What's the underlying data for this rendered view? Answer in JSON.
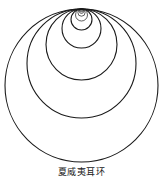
{
  "caption": "夏威夷耳环",
  "diagram": {
    "name": "Hawaiian earring",
    "tangent_point": {
      "x": 81.5,
      "y": 9
    },
    "stroke_color": "#1a1a1a",
    "radii": [
      76.5,
      54.5,
      35.5,
      19.5,
      10.5,
      6.0,
      3.6,
      2.2,
      1.4,
      0.9
    ]
  }
}
